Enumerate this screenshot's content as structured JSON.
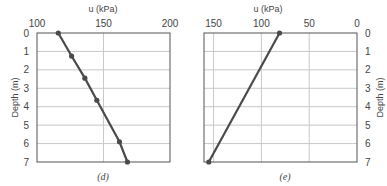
{
  "chart_data": [
    {
      "type": "line",
      "caption": "(d)",
      "title": "u (kPa)",
      "xlabel": "u (kPa)",
      "ylabel": "Depth (m)",
      "x_ticks": [
        "100",
        "150",
        "200"
      ],
      "y_ticks": [
        "0",
        "1",
        "2",
        "3",
        "4",
        "5",
        "6",
        "7"
      ],
      "xlim": [
        100,
        200
      ],
      "ylim": [
        7,
        0
      ],
      "grid": true,
      "y_axis_side": "left",
      "series": [
        {
          "name": "pore pressure",
          "x": [
            116,
            126,
            136,
            145,
            162,
            168
          ],
          "y": [
            0,
            1.25,
            2.45,
            3.65,
            5.9,
            7
          ],
          "markers": true
        }
      ]
    },
    {
      "type": "line",
      "caption": "(e)",
      "title": "u (kPa)",
      "xlabel": "u (kPa)",
      "ylabel": "Depth (m)",
      "x_ticks": [
        "150",
        "100",
        "50",
        "0"
      ],
      "y_ticks": [
        "0",
        "1",
        "2",
        "3",
        "4",
        "5",
        "6",
        "7"
      ],
      "xlim": [
        160,
        0
      ],
      "ylim": [
        7,
        0
      ],
      "grid": true,
      "y_axis_side": "right",
      "series": [
        {
          "name": "pore pressure",
          "x": [
            81,
            155
          ],
          "y": [
            0,
            7
          ],
          "markers": true
        }
      ]
    }
  ]
}
